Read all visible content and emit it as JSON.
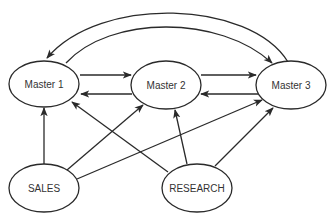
{
  "diagram": {
    "nodes": [
      {
        "id": "master1",
        "label": "Master 1",
        "cx": 44,
        "cy": 84,
        "rx": 35,
        "ry": 23
      },
      {
        "id": "master2",
        "label": "Master 2",
        "cx": 166,
        "cy": 85,
        "rx": 35,
        "ry": 24
      },
      {
        "id": "master3",
        "label": "Master 3",
        "cx": 291,
        "cy": 85,
        "rx": 35,
        "ry": 24
      },
      {
        "id": "sales",
        "label": "SALES",
        "cx": 44,
        "cy": 188,
        "rx": 35,
        "ry": 24
      },
      {
        "id": "research",
        "label": "RESEARCH",
        "cx": 197,
        "cy": 188,
        "rx": 35,
        "ry": 24
      }
    ],
    "edges": [
      {
        "from": "master1",
        "to": "master2"
      },
      {
        "from": "master2",
        "to": "master1"
      },
      {
        "from": "master2",
        "to": "master3"
      },
      {
        "from": "master3",
        "to": "master2"
      },
      {
        "from": "master1",
        "to": "master3",
        "style": "curved"
      },
      {
        "from": "master3",
        "to": "master1",
        "style": "curved"
      },
      {
        "from": "sales",
        "to": "master1"
      },
      {
        "from": "sales",
        "to": "master2"
      },
      {
        "from": "sales",
        "to": "master3"
      },
      {
        "from": "research",
        "to": "master1"
      },
      {
        "from": "research",
        "to": "master2"
      },
      {
        "from": "research",
        "to": "master3"
      }
    ],
    "colors": {
      "stroke": "#2a2a2a",
      "text": "#333333",
      "background": "#ffffff"
    }
  }
}
